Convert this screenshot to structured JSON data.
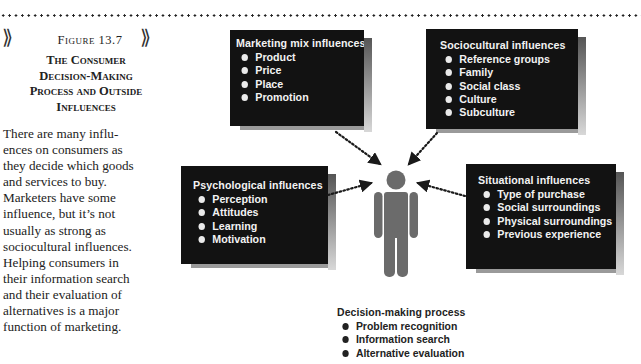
{
  "figure": {
    "label": "Figure 13.7",
    "title_lines": [
      "The Consumer",
      "Decision-Making",
      "Process and Outside",
      "Influences"
    ],
    "caption_lines": [
      "There are many influ-",
      "ences on consumers as",
      "they decide which goods",
      "and services to buy.",
      "Marketers have some",
      "influence, but it’s not",
      "usually as strong as",
      "sociocultural influences.",
      "Helping consumers in",
      "their information search",
      "and their evaluation of",
      "alternatives is a major",
      "function of marketing."
    ]
  },
  "diagram": {
    "marketing_mix": {
      "title": "Marketing mix influences",
      "items": [
        "Product",
        "Price",
        "Place",
        "Promotion"
      ]
    },
    "sociocultural": {
      "title": "Sociocultural influences",
      "items": [
        "Reference groups",
        "Family",
        "Social class",
        "Culture",
        "Subculture"
      ]
    },
    "psychological": {
      "title": "Psychological influences",
      "items": [
        "Perception",
        "Attitudes",
        "Learning",
        "Motivation"
      ]
    },
    "situational": {
      "title": "Situational influences",
      "items": [
        "Type of purchase",
        "Social surroundings",
        "Physical surroundings",
        "Previous experience"
      ]
    },
    "center_icon": "person-icon",
    "decision_process": {
      "title": "Decision-making process",
      "items": [
        "Problem recognition",
        "Information search",
        "Alternative evaluation"
      ]
    },
    "colors": {
      "box_fill": "#121212",
      "box_text": "#f2f2f2",
      "person": "#6b6b6b",
      "arrow": "#1a1a1a"
    }
  }
}
